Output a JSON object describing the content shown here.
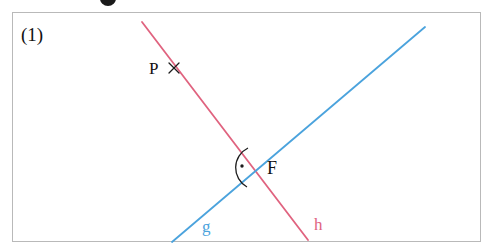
{
  "figure": {
    "index_label": "(1)",
    "frame": {
      "x": 12,
      "y": 12,
      "width": 469,
      "height": 230,
      "border_color": "#b9b9b9"
    },
    "background_color": "#ffffff",
    "heading_remnant": {
      "description": "cut-off bold heading glyph",
      "color": "#1a1a1a"
    }
  },
  "geometry": {
    "type": "two-intersecting-lines",
    "lines": [
      {
        "name": "h",
        "label": "h",
        "color": "#e0637f",
        "stroke_width": 1.8,
        "from": {
          "x": 142,
          "y": 22
        },
        "to": {
          "x": 308,
          "y": 240
        },
        "label_position": {
          "x": 314,
          "y": 216
        }
      },
      {
        "name": "g",
        "label": "g",
        "color": "#4ba3dd",
        "stroke_width": 1.8,
        "from": {
          "x": 172,
          "y": 242
        },
        "to": {
          "x": 425,
          "y": 27
        },
        "label_position": {
          "x": 202,
          "y": 218
        }
      }
    ],
    "points": [
      {
        "name": "P",
        "label": "P",
        "marker": "cross-x",
        "marker_color": "#1c1c1c",
        "lies_on": "h",
        "marker_position": {
          "x": 174,
          "y": 68
        },
        "label_position": {
          "x": 149,
          "y": 60
        }
      },
      {
        "name": "F",
        "label": "F",
        "marker": "none",
        "description": "intersection of g and h",
        "position": {
          "x": 257,
          "y": 168
        },
        "label_position": {
          "x": 267,
          "y": 159
        }
      }
    ],
    "angle_marks": [
      {
        "name": "right-angle-at-F",
        "style": "arc-with-dot",
        "color": "#1c1c1c",
        "at_point": "F",
        "opens_toward": "left",
        "arc_radius": 22,
        "dot": {
          "x": 242,
          "y": 166
        }
      }
    ]
  }
}
